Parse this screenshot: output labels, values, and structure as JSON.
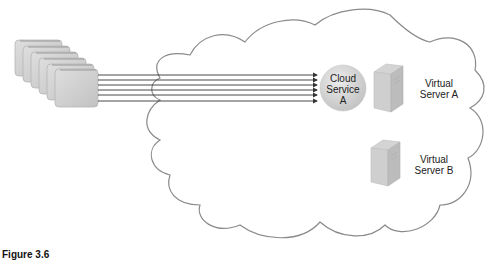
{
  "diagram": {
    "cloud": {
      "stroke": "#8a8a8a",
      "fill": "#ffffff"
    },
    "consumer_stack": {
      "count": 6,
      "fill": "#cfcfcf",
      "stroke": "#b5b5b5"
    },
    "connections": {
      "count": 6,
      "color": "#333333"
    },
    "service": {
      "line1": "Cloud",
      "line2": "Service",
      "line3": "A",
      "fill": "#d6d6d6"
    },
    "servers": [
      {
        "line1": "Virtual",
        "line2": "Server A"
      },
      {
        "line1": "Virtual",
        "line2": "Server B"
      }
    ],
    "caption": "Figure 3.6"
  }
}
